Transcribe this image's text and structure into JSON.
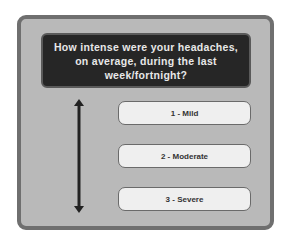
{
  "question": "How intense were your headaches, on average, during the last week/fortnight?",
  "options": [
    {
      "label": "1 - Mild"
    },
    {
      "label": "2 - Moderate"
    },
    {
      "label": "3 - Severe"
    }
  ],
  "scale_icon": "double-headed-vertical-arrow-icon"
}
